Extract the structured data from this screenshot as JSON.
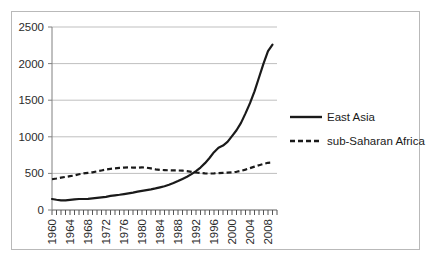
{
  "chart_data": {
    "type": "line",
    "title": "",
    "subtitle": "",
    "xlabel": "",
    "ylabel": "",
    "xlim": [
      1960,
      2010
    ],
    "ylim": [
      0,
      2500
    ],
    "yticks": [
      0,
      500,
      1000,
      1500,
      2000,
      2500
    ],
    "ytick_labels": [
      "0",
      "500",
      "1000",
      "1500",
      "2000",
      "2500"
    ],
    "xticks": [
      1960,
      1964,
      1968,
      1972,
      1976,
      1980,
      1984,
      1988,
      1992,
      1996,
      2000,
      2004,
      2008
    ],
    "xtick_labels": [
      "1960",
      "1964",
      "1968",
      "1972",
      "1976",
      "1980",
      "1984",
      "1988",
      "1992",
      "1996",
      "2000",
      "2004",
      "2008"
    ],
    "minor_xtick_interval": 1,
    "grid": "horizontal",
    "legend_position": "right",
    "x": [
      1960,
      1961,
      1962,
      1963,
      1964,
      1965,
      1966,
      1967,
      1968,
      1969,
      1970,
      1971,
      1972,
      1973,
      1974,
      1975,
      1976,
      1977,
      1978,
      1979,
      1980,
      1981,
      1982,
      1983,
      1984,
      1985,
      1986,
      1987,
      1988,
      1989,
      1990,
      1991,
      1992,
      1993,
      1994,
      1995,
      1996,
      1997,
      1998,
      1999,
      2000,
      2001,
      2002,
      2003,
      2004,
      2005,
      2006,
      2007,
      2008,
      2009
    ],
    "series": [
      {
        "name": "East Asia",
        "style": "solid",
        "color": "#1a1a1a",
        "values": [
          150,
          140,
          132,
          132,
          138,
          145,
          150,
          150,
          152,
          158,
          165,
          172,
          180,
          192,
          200,
          208,
          218,
          228,
          238,
          250,
          262,
          272,
          282,
          295,
          310,
          325,
          345,
          368,
          395,
          425,
          455,
          490,
          530,
          580,
          640,
          710,
          790,
          850,
          880,
          930,
          1010,
          1090,
          1190,
          1320,
          1460,
          1620,
          1810,
          2000,
          2170,
          2260
        ]
      },
      {
        "name": "sub-Saharan Africa",
        "style": "dashed",
        "color": "#1a1a1a",
        "values": [
          420,
          430,
          442,
          452,
          462,
          472,
          488,
          500,
          508,
          515,
          528,
          540,
          552,
          562,
          570,
          575,
          580,
          582,
          580,
          578,
          582,
          578,
          568,
          556,
          548,
          545,
          542,
          540,
          540,
          538,
          532,
          522,
          512,
          505,
          500,
          498,
          500,
          505,
          508,
          510,
          515,
          522,
          535,
          552,
          572,
          592,
          612,
          630,
          645,
          650
        ]
      }
    ],
    "legend": [
      {
        "label": "East Asia",
        "style": "solid"
      },
      {
        "label": "sub-Saharan Africa",
        "style": "dashed"
      }
    ],
    "colors": {
      "line": "#1a1a1a",
      "grid": "#bfbfbf",
      "axis": "#808080",
      "frame": "#b9b9b9",
      "text": "#2b2b2b",
      "background": "#ffffff"
    }
  }
}
